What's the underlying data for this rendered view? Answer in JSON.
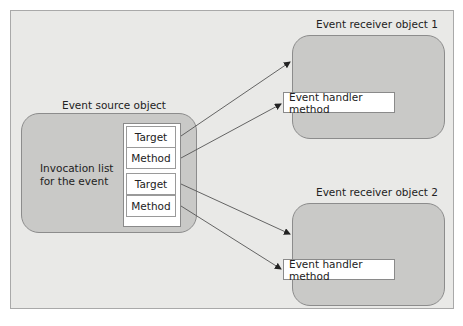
{
  "diagram": {
    "source": {
      "label": "Event source object",
      "invocation_text_line1": "Invocation list",
      "invocation_text_line2": "for the event",
      "entries": [
        {
          "target": "Target",
          "method": "Method"
        },
        {
          "target": "Target",
          "method": "Method"
        }
      ]
    },
    "receivers": [
      {
        "label": "Event receiver object 1",
        "handler": "Event handler method"
      },
      {
        "label": "Event receiver object 2",
        "handler": "Event handler method"
      }
    ],
    "edges": [
      {
        "from": "source.entries.0.target",
        "to": "receivers.0"
      },
      {
        "from": "source.entries.0.method",
        "to": "receivers.0.handler"
      },
      {
        "from": "source.entries.1.target",
        "to": "receivers.1"
      },
      {
        "from": "source.entries.1.method",
        "to": "receivers.1.handler"
      }
    ],
    "colors": {
      "panel": "#e9e9e7",
      "object_fill": "#c9c9c7",
      "box_fill": "#ffffff",
      "line": "#555555"
    }
  }
}
